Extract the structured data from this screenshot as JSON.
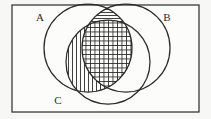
{
  "figure": {
    "type": "venn-diagram",
    "set_count": 3,
    "background_color": "#f7f7f5",
    "stroke_color": "#2b2b2b",
    "frame": {
      "name": "universal-set-rectangle",
      "x": 12,
      "y": 5,
      "width": 187,
      "height": 107,
      "stroke_width": 1.2
    },
    "circles": [
      {
        "id": "A",
        "label": "A",
        "cx": 88,
        "cy": 48,
        "r": 44
      },
      {
        "id": "B",
        "label": "B",
        "cx": 126,
        "cy": 48,
        "r": 44
      },
      {
        "id": "C",
        "label": "C",
        "cx": 108,
        "cy": 62,
        "r": 42
      }
    ],
    "labels": [
      {
        "id": "A",
        "text": "A",
        "x": 40,
        "y": 21
      },
      {
        "id": "B",
        "text": "B",
        "x": 167,
        "y": 21
      },
      {
        "id": "C",
        "text": "C",
        "x": 58,
        "y": 104
      }
    ],
    "shaded_regions": [
      {
        "id": "A-and-B-not-C",
        "description": "A intersect B minus C",
        "hatch": "horizontal",
        "hatch_spacing": 3
      },
      {
        "id": "A-and-B-and-C",
        "description": "A intersect B intersect C",
        "hatch": "crosshatch",
        "hatch_spacing": 4
      },
      {
        "id": "A-and-C-not-B",
        "description": "A intersect C minus B",
        "hatch": "vertical",
        "hatch_spacing": 4
      }
    ],
    "caption": ""
  }
}
